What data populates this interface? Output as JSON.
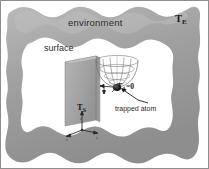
{
  "figure": {
    "name": "atom-trap-environment-diagram",
    "colors": {
      "frame_fill": "#9b9b9b",
      "frame_fill_light": "#b4b4b4",
      "frame_edge": "#6f6f6f",
      "interior": "#ffffff",
      "surface_slab": "#a8a8a8",
      "surface_slab_side": "#8f8f8f",
      "trap_mesh": "#7a7a7a",
      "atom": "#1c1c1c",
      "text": "#1a1a1a",
      "border": "#8a8a8a"
    },
    "labels": {
      "environment": "environment",
      "environment_temperature": "T",
      "environment_temperature_sub": "E",
      "surface": "surface",
      "surface_temperature": "T",
      "surface_temperature_sub": "S",
      "atom_temperature": "T",
      "atom_temperature_sub": "A",
      "atom_temperature_value": "=0",
      "trapped_atom": "trapped atom"
    },
    "axes": {
      "x": "x",
      "y": "y",
      "z": "z"
    }
  }
}
